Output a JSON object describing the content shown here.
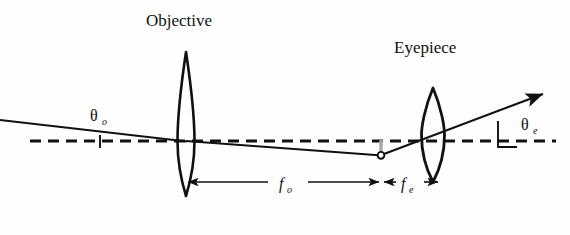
{
  "figure": {
    "kind": "optical-ray-diagram",
    "background_color": "#fefefe",
    "ink_color": "#111111",
    "gray_color": "#a8a8a8"
  },
  "labels": {
    "objective": "Objective",
    "eyepiece": "Eyepiece",
    "theta_base": "θ",
    "theta_o_sub": "o",
    "theta_e_sub": "e",
    "f_base": "f",
    "f_o_sub": "o",
    "f_e_sub": "e"
  },
  "elements": {
    "optical_axis": {
      "name": "optical-axis",
      "style": "dashed",
      "y": 141,
      "x_start": 30,
      "x_end": 556
    },
    "objective_lens": {
      "name": "objective-lens",
      "type": "biconvex",
      "center_x": 186,
      "top_y": 52,
      "bottom_y": 196,
      "half_width": 9
    },
    "eyepiece_lens": {
      "name": "eyepiece-lens",
      "type": "biconvex",
      "center_x": 433,
      "top_y": 88,
      "bottom_y": 182,
      "half_width": 11
    },
    "image_point": {
      "name": "intermediate-image-point",
      "x": 381,
      "y": 155,
      "radius": 3.4
    },
    "image_height_marker": {
      "name": "image-height-marker",
      "x": 381,
      "y_top": 141,
      "y_bottom": 155,
      "color": "#a8a8a8"
    },
    "incoming_ray": {
      "name": "incoming-ray",
      "from": [
        0,
        120
      ],
      "to": [
        186,
        141
      ]
    },
    "internal_ray": {
      "name": "internal-ray",
      "from": [
        186,
        141
      ],
      "to": [
        381,
        155
      ]
    },
    "outgoing_ray": {
      "name": "outgoing-ray",
      "from": [
        381,
        155
      ],
      "to": [
        545,
        93
      ],
      "arrowhead": true
    },
    "theta_o": {
      "name": "angle-theta-o",
      "label_x": 98,
      "label_y": 119,
      "tick_x": 100,
      "tick_y_top": 136,
      "tick_y_bottom": 148
    },
    "theta_e": {
      "name": "angle-theta-e",
      "label_x": 513,
      "label_y": 128,
      "tick_x": 498,
      "tick_y_top": 122,
      "tick_y_bottom": 147
    },
    "f_o_dimension": {
      "name": "focal-length-objective-dimension",
      "y": 182,
      "x_start": 186,
      "x_end": 381,
      "label_x": 288,
      "label_y": 188
    },
    "f_e_dimension": {
      "name": "focal-length-eyepiece-dimension",
      "y": 182,
      "x_start": 381,
      "x_end": 438,
      "label_x": 409,
      "label_y": 188
    }
  }
}
